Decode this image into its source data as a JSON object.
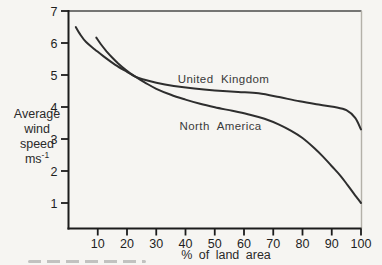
{
  "figure": {
    "background": "#f6f5f2",
    "axis_color": "#1c1c1c",
    "frame_top_color": "#4a4a4a",
    "frame_right_color": "#b4b1a9",
    "curve_color": "#2e2e2e",
    "text_color": "#2a2a2a"
  },
  "y_axis_label": {
    "lines": [
      "Average",
      "wind",
      "speed"
    ],
    "unit_base": "ms",
    "unit_exponent": "-1"
  },
  "chart_data": {
    "type": "line",
    "title": "",
    "xlabel": "% of land area",
    "ylabel": "Average wind speed ms^-1",
    "xlim": [
      0,
      100
    ],
    "ylim": [
      0.3,
      7
    ],
    "grid": false,
    "legend": "inline-labels",
    "x_ticks": [
      10,
      20,
      30,
      40,
      50,
      60,
      70,
      80,
      90,
      100
    ],
    "y_ticks": [
      7,
      6,
      5,
      4,
      3,
      2,
      1
    ],
    "series": [
      {
        "name": "United Kingdom",
        "label_pos": {
          "x": 53,
          "y": 4.88
        },
        "points": [
          [
            2.5,
            6.5
          ],
          [
            4,
            6.27
          ],
          [
            6,
            6.03
          ],
          [
            9,
            5.8
          ],
          [
            12,
            5.58
          ],
          [
            16,
            5.32
          ],
          [
            20,
            5.1
          ],
          [
            23,
            4.94
          ],
          [
            26,
            4.85
          ],
          [
            30,
            4.76
          ],
          [
            36,
            4.66
          ],
          [
            43,
            4.58
          ],
          [
            50,
            4.52
          ],
          [
            58,
            4.47
          ],
          [
            65,
            4.43
          ],
          [
            72,
            4.31
          ],
          [
            79,
            4.18
          ],
          [
            86,
            4.07
          ],
          [
            91,
            4.0
          ],
          [
            95,
            3.9
          ],
          [
            98,
            3.66
          ],
          [
            100,
            3.3
          ]
        ]
      },
      {
        "name": "North America",
        "label_pos": {
          "x": 52,
          "y": 3.41
        },
        "points": [
          [
            9.5,
            6.17
          ],
          [
            11,
            5.97
          ],
          [
            13,
            5.74
          ],
          [
            15,
            5.54
          ],
          [
            17,
            5.36
          ],
          [
            19,
            5.2
          ],
          [
            21,
            5.06
          ],
          [
            23,
            4.94
          ],
          [
            26,
            4.77
          ],
          [
            30,
            4.57
          ],
          [
            35,
            4.38
          ],
          [
            40,
            4.23
          ],
          [
            45,
            4.1
          ],
          [
            50,
            3.99
          ],
          [
            56,
            3.88
          ],
          [
            62,
            3.76
          ],
          [
            67,
            3.63
          ],
          [
            72,
            3.45
          ],
          [
            76,
            3.26
          ],
          [
            80,
            3.03
          ],
          [
            84,
            2.72
          ],
          [
            87,
            2.45
          ],
          [
            90,
            2.15
          ],
          [
            93,
            1.85
          ],
          [
            95.5,
            1.55
          ],
          [
            97.5,
            1.3
          ],
          [
            99,
            1.12
          ],
          [
            100,
            1.0
          ]
        ]
      }
    ]
  }
}
